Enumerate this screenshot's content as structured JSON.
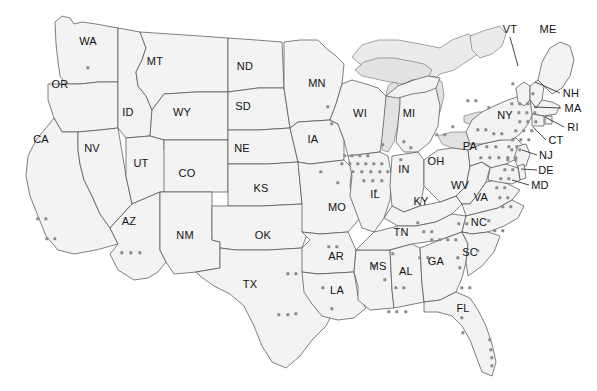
{
  "map": {
    "title": "United States state map with point distribution",
    "width": 597,
    "height": 391,
    "colors": {
      "background": "#ffffff",
      "state_fill": "#f3f3f3",
      "state_border": "#4a4a4a",
      "lake_fill": "#e2e2e2",
      "canada_fill": "#ebebeb",
      "dot": "#8c8c8c",
      "label_text": "#111111"
    }
  },
  "labels": [
    {
      "text": "WA",
      "x": 88,
      "y": 41,
      "leader": null
    },
    {
      "text": "OR",
      "x": 60,
      "y": 84,
      "leader": null
    },
    {
      "text": "CA",
      "x": 41,
      "y": 139,
      "leader": null
    },
    {
      "text": "NV",
      "x": 92,
      "y": 148,
      "leader": null
    },
    {
      "text": "ID",
      "x": 128,
      "y": 112,
      "leader": null
    },
    {
      "text": "MT",
      "x": 155,
      "y": 61,
      "leader": null
    },
    {
      "text": "WY",
      "x": 182,
      "y": 112,
      "leader": null
    },
    {
      "text": "UT",
      "x": 141,
      "y": 163,
      "leader": null
    },
    {
      "text": "AZ",
      "x": 129,
      "y": 221,
      "leader": null
    },
    {
      "text": "CO",
      "x": 187,
      "y": 173,
      "leader": null
    },
    {
      "text": "NM",
      "x": 185,
      "y": 235,
      "leader": null
    },
    {
      "text": "ND",
      "x": 245,
      "y": 66,
      "leader": null
    },
    {
      "text": "SD",
      "x": 243,
      "y": 106,
      "leader": null
    },
    {
      "text": "NE",
      "x": 242,
      "y": 148,
      "leader": null
    },
    {
      "text": "KS",
      "x": 261,
      "y": 188,
      "leader": null
    },
    {
      "text": "OK",
      "x": 263,
      "y": 235,
      "leader": null
    },
    {
      "text": "TX",
      "x": 250,
      "y": 284,
      "leader": null
    },
    {
      "text": "MN",
      "x": 317,
      "y": 83,
      "leader": null
    },
    {
      "text": "IA",
      "x": 313,
      "y": 139,
      "leader": null
    },
    {
      "text": "MO",
      "x": 337,
      "y": 207,
      "leader": null
    },
    {
      "text": "AR",
      "x": 336,
      "y": 256,
      "leader": null
    },
    {
      "text": "LA",
      "x": 337,
      "y": 290,
      "leader": null
    },
    {
      "text": "WI",
      "x": 360,
      "y": 113,
      "leader": null
    },
    {
      "text": "IL",
      "x": 375,
      "y": 194,
      "leader": null
    },
    {
      "text": "MS",
      "x": 378,
      "y": 266,
      "leader": null
    },
    {
      "text": "MI",
      "x": 409,
      "y": 113,
      "leader": null
    },
    {
      "text": "IN",
      "x": 404,
      "y": 169,
      "leader": null
    },
    {
      "text": "KY",
      "x": 421,
      "y": 201,
      "leader": null
    },
    {
      "text": "TN",
      "x": 401,
      "y": 232,
      "leader": null
    },
    {
      "text": "AL",
      "x": 406,
      "y": 271,
      "leader": null
    },
    {
      "text": "OH",
      "x": 436,
      "y": 161,
      "leader": null
    },
    {
      "text": "GA",
      "x": 436,
      "y": 261,
      "leader": null
    },
    {
      "text": "FL",
      "x": 463,
      "y": 308,
      "leader": null
    },
    {
      "text": "WV",
      "x": 460,
      "y": 185,
      "leader": null
    },
    {
      "text": "VA",
      "x": 481,
      "y": 197,
      "leader": null
    },
    {
      "text": "NC",
      "x": 479,
      "y": 222,
      "leader": null
    },
    {
      "text": "SC",
      "x": 470,
      "y": 252,
      "leader": null
    },
    {
      "text": "PA",
      "x": 470,
      "y": 146,
      "leader": null
    },
    {
      "text": "NY",
      "x": 505,
      "y": 115,
      "leader": null
    },
    {
      "text": "VT",
      "x": 510,
      "y": 29,
      "leader": {
        "x1": 510,
        "y1": 37,
        "x2": 518,
        "y2": 66
      }
    },
    {
      "text": "ME",
      "x": 548,
      "y": 29,
      "leader": null
    },
    {
      "text": "NH",
      "x": 571,
      "y": 93,
      "leader": {
        "x1": 560,
        "y1": 93,
        "x2": 535,
        "y2": 82
      }
    },
    {
      "text": "MA",
      "x": 573,
      "y": 108,
      "leader": {
        "x1": 561,
        "y1": 108,
        "x2": 534,
        "y2": 107
      }
    },
    {
      "text": "RI",
      "x": 573,
      "y": 127,
      "leader": {
        "x1": 564,
        "y1": 127,
        "x2": 545,
        "y2": 117
      }
    },
    {
      "text": "CT",
      "x": 556,
      "y": 140,
      "leader": {
        "x1": 546,
        "y1": 140,
        "x2": 533,
        "y2": 127
      }
    },
    {
      "text": "NJ",
      "x": 546,
      "y": 155,
      "leader": {
        "x1": 537,
        "y1": 155,
        "x2": 522,
        "y2": 150
      }
    },
    {
      "text": "DE",
      "x": 546,
      "y": 170,
      "leader": {
        "x1": 537,
        "y1": 170,
        "x2": 521,
        "y2": 169
      }
    },
    {
      "text": "MD",
      "x": 540,
      "y": 185,
      "leader": {
        "x1": 529,
        "y1": 185,
        "x2": 512,
        "y2": 180
      }
    }
  ],
  "dots": [
    {
      "x": 88,
      "y": 68
    },
    {
      "x": 38,
      "y": 219
    },
    {
      "x": 46,
      "y": 219
    },
    {
      "x": 47,
      "y": 239
    },
    {
      "x": 55,
      "y": 239
    },
    {
      "x": 122,
      "y": 253
    },
    {
      "x": 131,
      "y": 253
    },
    {
      "x": 140,
      "y": 253
    },
    {
      "x": 288,
      "y": 274
    },
    {
      "x": 296,
      "y": 274
    },
    {
      "x": 279,
      "y": 315
    },
    {
      "x": 288,
      "y": 315
    },
    {
      "x": 296,
      "y": 314
    },
    {
      "x": 321,
      "y": 172
    },
    {
      "x": 338,
      "y": 183
    },
    {
      "x": 329,
      "y": 247
    },
    {
      "x": 337,
      "y": 247
    },
    {
      "x": 323,
      "y": 288
    },
    {
      "x": 332,
      "y": 309
    },
    {
      "x": 328,
      "y": 107
    },
    {
      "x": 332,
      "y": 124
    },
    {
      "x": 345,
      "y": 156
    },
    {
      "x": 352,
      "y": 156
    },
    {
      "x": 360,
      "y": 156
    },
    {
      "x": 368,
      "y": 156
    },
    {
      "x": 342,
      "y": 164
    },
    {
      "x": 350,
      "y": 164
    },
    {
      "x": 358,
      "y": 164
    },
    {
      "x": 366,
      "y": 164
    },
    {
      "x": 374,
      "y": 164
    },
    {
      "x": 382,
      "y": 164
    },
    {
      "x": 353,
      "y": 172
    },
    {
      "x": 362,
      "y": 172
    },
    {
      "x": 371,
      "y": 172
    },
    {
      "x": 380,
      "y": 172
    },
    {
      "x": 388,
      "y": 172
    },
    {
      "x": 364,
      "y": 181
    },
    {
      "x": 373,
      "y": 181
    },
    {
      "x": 382,
      "y": 181
    },
    {
      "x": 376,
      "y": 191
    },
    {
      "x": 383,
      "y": 145
    },
    {
      "x": 404,
      "y": 142
    },
    {
      "x": 411,
      "y": 148
    },
    {
      "x": 401,
      "y": 160
    },
    {
      "x": 374,
      "y": 266
    },
    {
      "x": 385,
      "y": 280
    },
    {
      "x": 389,
      "y": 312
    },
    {
      "x": 397,
      "y": 312
    },
    {
      "x": 406,
      "y": 312
    },
    {
      "x": 418,
      "y": 223
    },
    {
      "x": 424,
      "y": 232
    },
    {
      "x": 432,
      "y": 232
    },
    {
      "x": 420,
      "y": 258
    },
    {
      "x": 428,
      "y": 258
    },
    {
      "x": 396,
      "y": 288
    },
    {
      "x": 404,
      "y": 288
    },
    {
      "x": 393,
      "y": 254
    },
    {
      "x": 432,
      "y": 240
    },
    {
      "x": 440,
      "y": 240
    },
    {
      "x": 448,
      "y": 240
    },
    {
      "x": 456,
      "y": 240
    },
    {
      "x": 459,
      "y": 224
    },
    {
      "x": 467,
      "y": 224
    },
    {
      "x": 489,
      "y": 221
    },
    {
      "x": 495,
      "y": 231
    },
    {
      "x": 503,
      "y": 231
    },
    {
      "x": 478,
      "y": 251
    },
    {
      "x": 458,
      "y": 258
    },
    {
      "x": 460,
      "y": 268
    },
    {
      "x": 462,
      "y": 288
    },
    {
      "x": 470,
      "y": 288
    },
    {
      "x": 462,
      "y": 318
    },
    {
      "x": 463,
      "y": 333
    },
    {
      "x": 490,
      "y": 340
    },
    {
      "x": 491,
      "y": 350
    },
    {
      "x": 492,
      "y": 358
    },
    {
      "x": 492,
      "y": 366
    },
    {
      "x": 437,
      "y": 135
    },
    {
      "x": 445,
      "y": 135
    },
    {
      "x": 453,
      "y": 127
    },
    {
      "x": 478,
      "y": 130
    },
    {
      "x": 486,
      "y": 130
    },
    {
      "x": 494,
      "y": 134
    },
    {
      "x": 502,
      "y": 134
    },
    {
      "x": 487,
      "y": 147
    },
    {
      "x": 496,
      "y": 147
    },
    {
      "x": 509,
      "y": 147
    },
    {
      "x": 517,
      "y": 147
    },
    {
      "x": 481,
      "y": 158
    },
    {
      "x": 490,
      "y": 158
    },
    {
      "x": 499,
      "y": 158
    },
    {
      "x": 508,
      "y": 158
    },
    {
      "x": 516,
      "y": 158
    },
    {
      "x": 468,
      "y": 101
    },
    {
      "x": 476,
      "y": 101
    },
    {
      "x": 489,
      "y": 108
    },
    {
      "x": 512,
      "y": 104
    },
    {
      "x": 520,
      "y": 104
    },
    {
      "x": 528,
      "y": 104
    },
    {
      "x": 519,
      "y": 113
    },
    {
      "x": 527,
      "y": 113
    },
    {
      "x": 535,
      "y": 113
    },
    {
      "x": 520,
      "y": 122
    },
    {
      "x": 528,
      "y": 122
    },
    {
      "x": 536,
      "y": 122
    },
    {
      "x": 516,
      "y": 131
    },
    {
      "x": 524,
      "y": 131
    },
    {
      "x": 532,
      "y": 131
    },
    {
      "x": 513,
      "y": 140
    },
    {
      "x": 521,
      "y": 140
    },
    {
      "x": 529,
      "y": 140
    },
    {
      "x": 512,
      "y": 150
    },
    {
      "x": 520,
      "y": 150
    },
    {
      "x": 508,
      "y": 160
    },
    {
      "x": 516,
      "y": 160
    },
    {
      "x": 505,
      "y": 170
    },
    {
      "x": 513,
      "y": 170
    },
    {
      "x": 501,
      "y": 179
    },
    {
      "x": 509,
      "y": 179
    },
    {
      "x": 497,
      "y": 188
    },
    {
      "x": 505,
      "y": 188
    },
    {
      "x": 500,
      "y": 198
    },
    {
      "x": 508,
      "y": 198
    },
    {
      "x": 503,
      "y": 207
    },
    {
      "x": 511,
      "y": 207
    },
    {
      "x": 513,
      "y": 84
    },
    {
      "x": 533,
      "y": 94
    }
  ]
}
